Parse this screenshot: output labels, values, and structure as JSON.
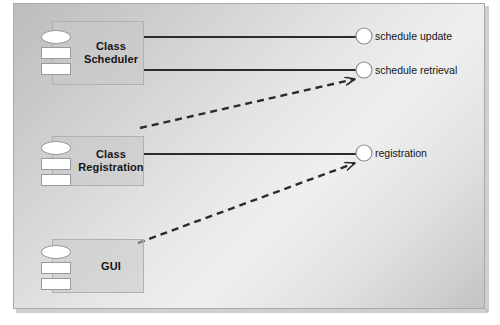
{
  "diagram": {
    "kind": "uml-component-diagram",
    "components": [
      {
        "id": "class-scheduler",
        "label": "Class\nScheduler",
        "icon": "component-icon"
      },
      {
        "id": "class-registration",
        "label": "Class\nRegistration",
        "icon": "component-icon"
      },
      {
        "id": "gui",
        "label": "GUI",
        "icon": "component-icon"
      }
    ],
    "interfaces": [
      {
        "id": "schedule-update",
        "label": "schedule update"
      },
      {
        "id": "schedule-retrieval",
        "label": "schedule retrieval"
      },
      {
        "id": "registration",
        "label": "registration"
      }
    ],
    "connections": [
      {
        "from": "class-scheduler",
        "to": "schedule-update",
        "style": "solid",
        "meaning": "provides"
      },
      {
        "from": "class-scheduler",
        "to": "schedule-retrieval",
        "style": "solid",
        "meaning": "provides"
      },
      {
        "from": "class-registration",
        "to": "registration",
        "style": "solid",
        "meaning": "provides"
      },
      {
        "from": "class-registration",
        "to": "schedule-retrieval",
        "style": "dashed",
        "meaning": "depends-on"
      },
      {
        "from": "gui",
        "to": "registration",
        "style": "dashed",
        "meaning": "depends-on"
      }
    ]
  },
  "colors": {
    "line": "#2b2b2b",
    "component_fill": "#c8c8c8",
    "component_border": "#b0b0b0",
    "interface_fill": "#ffffff",
    "interface_border": "#8f8f8f",
    "text": "#151515",
    "frame_border": "#a9a9a9"
  }
}
